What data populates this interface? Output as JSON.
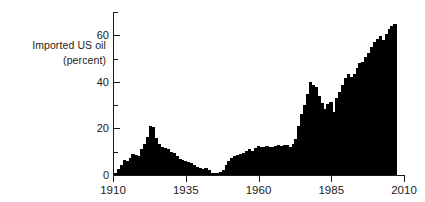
{
  "chart_data": {
    "type": "bar",
    "title": "",
    "subtitle": "",
    "xlabel": "",
    "ylabel": "Imported US oil (percent)",
    "ylabel_lines": [
      "Imported US oil",
      "(percent)"
    ],
    "xlim": [
      1910,
      2010
    ],
    "ylim": [
      0,
      70
    ],
    "grid": false,
    "legend": null,
    "ytick_labels": [
      "0",
      "20",
      "40",
      "60"
    ],
    "ytick_values": [
      0,
      20,
      40,
      60
    ],
    "yminor_values": [
      10,
      30,
      50,
      70
    ],
    "xtick_labels": [
      "1910",
      "1935",
      "1960",
      "1985",
      "2010"
    ],
    "xtick_values": [
      1910,
      1935,
      1960,
      1985,
      2010
    ],
    "series_name": "Imported US oil (percent)",
    "bar_color": "#000000",
    "axis_color": "#1a1a1a",
    "background_color": "#ffffff",
    "x": [
      1910,
      1911,
      1912,
      1913,
      1914,
      1915,
      1916,
      1917,
      1918,
      1919,
      1920,
      1921,
      1922,
      1923,
      1924,
      1925,
      1926,
      1927,
      1928,
      1929,
      1930,
      1931,
      1932,
      1933,
      1934,
      1935,
      1936,
      1937,
      1938,
      1939,
      1940,
      1941,
      1942,
      1943,
      1944,
      1945,
      1946,
      1947,
      1948,
      1949,
      1950,
      1951,
      1952,
      1953,
      1954,
      1955,
      1956,
      1957,
      1958,
      1959,
      1960,
      1961,
      1962,
      1963,
      1964,
      1965,
      1966,
      1967,
      1968,
      1969,
      1970,
      1971,
      1972,
      1973,
      1974,
      1975,
      1976,
      1977,
      1978,
      1979,
      1980,
      1981,
      1982,
      1983,
      1984,
      1985,
      1986,
      1987,
      1988,
      1989,
      1990,
      1991,
      1992,
      1993,
      1994,
      1995,
      1996,
      1997,
      1998,
      1999,
      2000,
      2001,
      2002,
      2003,
      2004,
      2005,
      2006
    ],
    "values": [
      1.0,
      2.5,
      4.5,
      6.5,
      6.0,
      7.5,
      9.0,
      8.5,
      8.0,
      11.0,
      13.5,
      16.5,
      21.0,
      20.5,
      16.0,
      13.5,
      12.0,
      11.5,
      11.0,
      10.0,
      9.5,
      8.0,
      7.0,
      6.5,
      6.0,
      5.5,
      5.0,
      4.5,
      3.5,
      3.0,
      2.5,
      3.0,
      2.0,
      1.0,
      0.8,
      1.0,
      1.5,
      2.0,
      4.5,
      6.0,
      7.5,
      8.0,
      8.5,
      9.0,
      9.5,
      10.5,
      11.0,
      10.5,
      11.5,
      12.5,
      12.0,
      12.0,
      12.5,
      12.0,
      12.0,
      12.5,
      13.0,
      12.5,
      13.0,
      13.0,
      12.0,
      13.5,
      15.5,
      21.0,
      26.0,
      30.0,
      35.0,
      40.0,
      38.5,
      38.0,
      34.0,
      31.0,
      28.5,
      30.5,
      31.5,
      27.0,
      33.0,
      35.5,
      38.5,
      41.5,
      43.5,
      42.0,
      43.5,
      46.0,
      48.0,
      48.5,
      50.5,
      52.5,
      55.0,
      57.0,
      58.5,
      59.5,
      58.0,
      60.5,
      62.5,
      64.0,
      65.0
    ]
  }
}
